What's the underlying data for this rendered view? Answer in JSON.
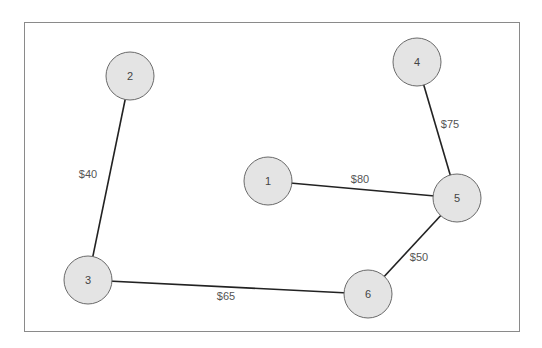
{
  "diagram": {
    "type": "weighted-graph",
    "frame": {
      "x": 24,
      "y": 22,
      "width": 496,
      "height": 310
    },
    "node_radius": 24,
    "nodes": [
      {
        "id": "1",
        "label": "1",
        "x": 268,
        "y": 181
      },
      {
        "id": "2",
        "label": "2",
        "x": 130,
        "y": 76
      },
      {
        "id": "3",
        "label": "3",
        "x": 88,
        "y": 280
      },
      {
        "id": "4",
        "label": "4",
        "x": 417,
        "y": 62
      },
      {
        "id": "5",
        "label": "5",
        "x": 457,
        "y": 198
      },
      {
        "id": "6",
        "label": "6",
        "x": 368,
        "y": 294
      }
    ],
    "edges": [
      {
        "from": "2",
        "to": "3",
        "label": "$40",
        "lx": 88,
        "ly": 174
      },
      {
        "from": "3",
        "to": "6",
        "label": "$65",
        "lx": 226,
        "ly": 296
      },
      {
        "from": "1",
        "to": "5",
        "label": "$80",
        "lx": 360,
        "ly": 179
      },
      {
        "from": "4",
        "to": "5",
        "label": "$75",
        "lx": 450,
        "ly": 124
      },
      {
        "from": "6",
        "to": "5",
        "label": "$50",
        "lx": 419,
        "ly": 257
      }
    ]
  }
}
